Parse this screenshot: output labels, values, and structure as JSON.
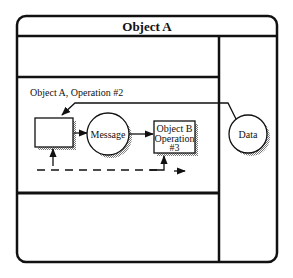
{
  "diagram": {
    "title": "Object A",
    "operation_label": "Object A, Operation #2",
    "nodes": {
      "process_box": {
        "label": ""
      },
      "message": {
        "label": "Message"
      },
      "object_b": {
        "lines": [
          "Object B",
          "Operation",
          "#3"
        ]
      },
      "data": {
        "label": "Data"
      }
    },
    "colors": {
      "stroke": "#111111",
      "background": "#ffffff",
      "shadow": "#9a9a9a"
    }
  }
}
